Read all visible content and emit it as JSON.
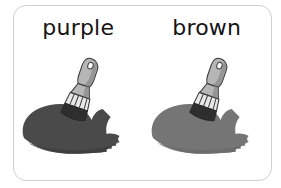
{
  "card": {
    "background_color": "#ffffff",
    "border_color": "#cfcfcf",
    "corner_radius_px": 13
  },
  "swatches": [
    {
      "label": "purple",
      "paint_color": "#4a4a4a",
      "paint_shadow_color": "#3e3e3e",
      "icon": "paintbrush-icon",
      "brush_handle_color": "#b6b6b6",
      "brush_handle_shade": "#8f8f8f",
      "brush_ferrule_color": "#e8e8e8",
      "brush_bristle_color": "#2e2e2e",
      "brush_outline_color": "#3b3b3b"
    },
    {
      "label": "brown",
      "paint_color": "#757575",
      "paint_shadow_color": "#6a6a6a",
      "icon": "paintbrush-icon",
      "brush_handle_color": "#b6b6b6",
      "brush_handle_shade": "#8f8f8f",
      "brush_ferrule_color": "#e8e8e8",
      "brush_bristle_color": "#2e2e2e",
      "brush_outline_color": "#3b3b3b"
    }
  ]
}
